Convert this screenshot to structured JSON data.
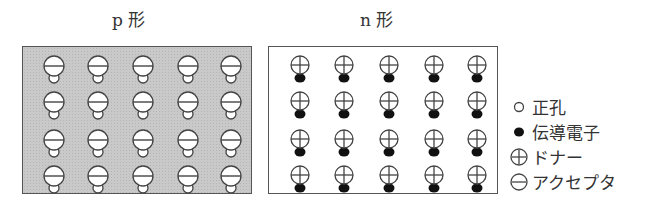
{
  "panels": [
    {
      "id": "p",
      "title": "p 形",
      "rows": 4,
      "cols": 5,
      "ion": "acceptor",
      "carrier": "hole",
      "background": "#c9c9c9"
    },
    {
      "id": "n",
      "title": "n 形",
      "rows": 4,
      "cols": 5,
      "ion": "donor",
      "carrier": "electron",
      "background": "#ffffff"
    }
  ],
  "legend": {
    "items": [
      {
        "icon": "hole-open-circle-icon",
        "label": "正孔"
      },
      {
        "icon": "electron-filled-circle-icon",
        "label": "伝導電子"
      },
      {
        "icon": "donor-plus-circle-icon",
        "label": "ドナー"
      },
      {
        "icon": "acceptor-minus-circle-icon",
        "label": "アクセプタ"
      }
    ]
  },
  "colors": {
    "stroke": "#444444",
    "electron": "#111111",
    "p_fill": "#c9c9c9"
  }
}
